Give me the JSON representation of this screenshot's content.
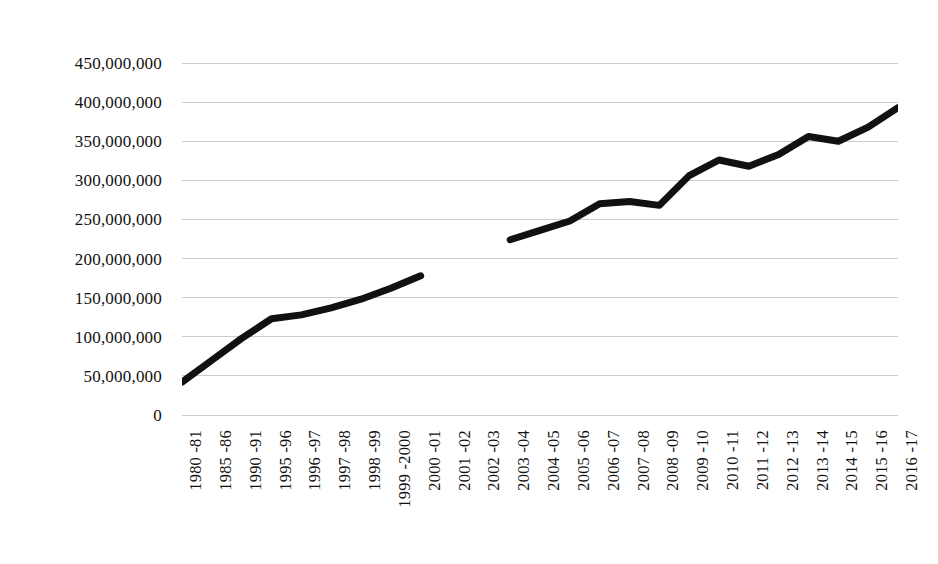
{
  "chart_data": {
    "type": "line",
    "title": "",
    "subtitle": "",
    "xlabel": "",
    "ylabel": "",
    "legend": [],
    "legend_position": "none",
    "grid": true,
    "grid_axis": "y",
    "line_color": "#111111",
    "grid_color": "#c9c9c9",
    "background_color": "#ffffff",
    "ylim": [
      0,
      450000000
    ],
    "ytick_step": 50000000,
    "ytick_labels": [
      "450,000,000",
      "400,000,000",
      "350,000,000",
      "300,000,000",
      "250,000,000",
      "200,000,000",
      "150,000,000",
      "100,000,000",
      "50,000,000",
      "0"
    ],
    "ytick_values": [
      450000000,
      400000000,
      350000000,
      300000000,
      250000000,
      200000000,
      150000000,
      100000000,
      50000000,
      0
    ],
    "categories": [
      "1980 -81",
      "1985 -86",
      "1990 -91",
      "1995 -96",
      "1996 -97",
      "1997 -98",
      "1998 -99",
      "1999 -2000",
      "2000 -01",
      "2001 -02",
      "2002 -03",
      "2003 -04",
      "2004 -05",
      "2005 -06",
      "2006 -07",
      "2007 -08",
      "2008 -09",
      "2009 -10",
      "2010 -11",
      "2011 -12",
      "2012 -13",
      "2013 -14",
      "2014 -15",
      "2015 -16",
      "2016 -17"
    ],
    "values": [
      42000000,
      70000000,
      98000000,
      123000000,
      128000000,
      137000000,
      148000000,
      162000000,
      178000000,
      null,
      null,
      224000000,
      236000000,
      248000000,
      270000000,
      273000000,
      268000000,
      306000000,
      326000000,
      318000000,
      333000000,
      356000000,
      350000000,
      368000000,
      393000000
    ],
    "missing_categories": [
      "2001 -02",
      "2002 -03"
    ],
    "note": "Series is broken between 2000-01 and 2003-04 (no data plotted for 2001-02 and 2002-03)."
  }
}
